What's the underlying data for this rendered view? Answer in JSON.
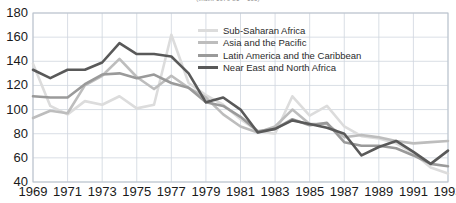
{
  "chart_data": {
    "type": "line",
    "title": "(Index 1979-81 = 100)",
    "xlabel": "",
    "ylabel": "",
    "xlim": [
      1969,
      1993
    ],
    "ylim": [
      40,
      180
    ],
    "ygrid": true,
    "xgrid": true,
    "ytick_step": 20,
    "yticks": [
      40,
      60,
      80,
      100,
      120,
      140,
      160,
      180
    ],
    "x": [
      1969,
      1970,
      1971,
      1972,
      1973,
      1974,
      1975,
      1976,
      1977,
      1978,
      1979,
      1980,
      1981,
      1982,
      1983,
      1984,
      1985,
      1986,
      1987,
      1988,
      1989,
      1990,
      1991,
      1992,
      1993
    ],
    "xticks": [
      1969,
      1971,
      1973,
      1975,
      1977,
      1979,
      1981,
      1983,
      1985,
      1987,
      1989,
      1991,
      1993
    ],
    "xtick_labels": [
      "1969",
      "1971",
      "1973",
      "1975",
      "1977",
      "1979",
      "1981",
      "1983",
      "1985",
      "1987",
      "1989",
      "1991",
      "1993"
    ],
    "legend_position": "inside-top-center",
    "series": [
      {
        "name": "Sub-Saharan Africa",
        "color": "#dcdcdc",
        "values": [
          138,
          103,
          96,
          107,
          104,
          111,
          101,
          104,
          162,
          122,
          112,
          104,
          92,
          82,
          80,
          111,
          95,
          103,
          86,
          78,
          76,
          72,
          64,
          52,
          47
        ]
      },
      {
        "name": "Asia and the Pacific",
        "color": "#bdbdbd",
        "values": [
          93,
          99,
          97,
          120,
          128,
          142,
          127,
          117,
          128,
          118,
          110,
          96,
          86,
          81,
          86,
          100,
          88,
          88,
          77,
          79,
          77,
          74,
          72,
          73,
          74
        ]
      },
      {
        "name": "Latin America and the Caribbean",
        "color": "#9a9a9a",
        "values": [
          111,
          110,
          110,
          121,
          129,
          130,
          126,
          129,
          122,
          118,
          106,
          103,
          94,
          82,
          84,
          92,
          87,
          89,
          73,
          70,
          70,
          68,
          62,
          55,
          53
        ]
      },
      {
        "name": "Near East and North Africa",
        "color": "#595959",
        "values": [
          133,
          126,
          133,
          133,
          139,
          155,
          146,
          146,
          144,
          130,
          106,
          110,
          100,
          81,
          84,
          91,
          88,
          85,
          80,
          62,
          69,
          74,
          65,
          55,
          66
        ]
      }
    ]
  }
}
